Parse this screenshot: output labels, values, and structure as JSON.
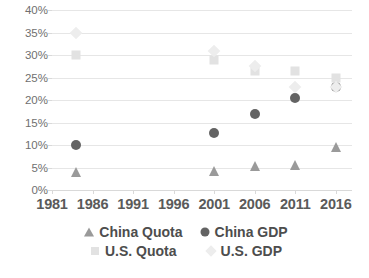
{
  "chart_data": {
    "type": "scatter",
    "title": "",
    "xlabel": "",
    "ylabel": "",
    "xlim": [
      1981,
      2018
    ],
    "ylim": [
      0,
      40
    ],
    "ytick_labels": [
      "0%",
      "5%",
      "10%",
      "15%",
      "20%",
      "25%",
      "30%",
      "35%",
      "40%"
    ],
    "ytick_values": [
      0,
      5,
      10,
      15,
      20,
      25,
      30,
      35,
      40
    ],
    "xtick_labels": [
      "1981",
      "1986",
      "1991",
      "1996",
      "2001",
      "2006",
      "2011",
      "2016"
    ],
    "xtick_values": [
      1981,
      1986,
      1991,
      1996,
      2001,
      2006,
      2011,
      2016
    ],
    "grid": "horizontal",
    "legend_position": "bottom",
    "series": [
      {
        "name": "China Quota",
        "marker": "triangle",
        "color": "#9a9a9a",
        "x": [
          1984,
          2001,
          2006,
          2011,
          2016
        ],
        "values": [
          4.0,
          4.3,
          5.4,
          5.6,
          9.5
        ]
      },
      {
        "name": "China GDP",
        "marker": "circle",
        "color": "#636363",
        "x": [
          1984,
          2001,
          2006,
          2011,
          2016
        ],
        "values": [
          10.0,
          12.7,
          17.0,
          20.5,
          23.0
        ]
      },
      {
        "name": "U.S. Quota",
        "marker": "square",
        "color": "#e2e2e2",
        "x": [
          1984,
          2001,
          2006,
          2011,
          2016
        ],
        "values": [
          30.0,
          29.0,
          26.5,
          26.5,
          25.0
        ]
      },
      {
        "name": "U.S. GDP",
        "marker": "diamond",
        "color": "#ededed",
        "x": [
          1984,
          2001,
          2006,
          2011,
          2016
        ],
        "values": [
          35.0,
          31.0,
          27.5,
          23.0,
          23.0
        ]
      }
    ]
  },
  "legend": {
    "rows": [
      [
        "China Quota",
        "China GDP"
      ],
      [
        "U.S. Quota",
        "U.S. GDP"
      ]
    ]
  }
}
